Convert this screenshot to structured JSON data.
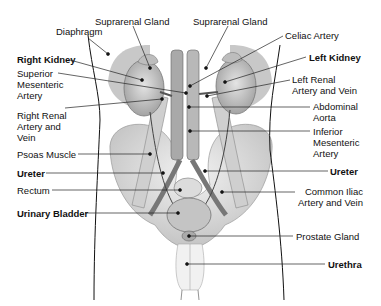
{
  "diagram": {
    "title_cutoff": "",
    "labels_left": [
      {
        "id": "diaphragm",
        "text": "Diaphragm",
        "bold": false
      },
      {
        "id": "right-kidney",
        "text": "Right Kidney",
        "bold": true
      },
      {
        "id": "superior-mesenteric-artery",
        "text": "Superior\nMesenteric\nArtery",
        "bold": false
      },
      {
        "id": "right-renal-artery-vein",
        "text": "Right Renal\nArtery and\nVein",
        "bold": false
      },
      {
        "id": "psoas-muscle",
        "text": "Psoas Muscle",
        "bold": false
      },
      {
        "id": "ureter-left-side",
        "text": "Ureter",
        "bold": true
      },
      {
        "id": "rectum",
        "text": "Rectum",
        "bold": false
      },
      {
        "id": "urinary-bladder",
        "text": "Urinary Bladder",
        "bold": true
      }
    ],
    "labels_top": [
      {
        "id": "suprarenal-gland-right",
        "text": "Suprarenal Gland",
        "bold": false
      },
      {
        "id": "suprarenal-gland-left",
        "text": "Suprarenal Gland",
        "bold": false
      }
    ],
    "labels_right": [
      {
        "id": "celiac-artery",
        "text": "Celiac Artery",
        "bold": false
      },
      {
        "id": "left-kidney",
        "text": "Left Kidney",
        "bold": true
      },
      {
        "id": "left-renal-artery-vein",
        "text": "Left Renal\nArtery and Vein",
        "bold": false
      },
      {
        "id": "abdominal-aorta",
        "text": "Abdominal\nAorta",
        "bold": false
      },
      {
        "id": "inferior-mesenteric-artery",
        "text": "Inferior\nMesenteric\nArtery",
        "bold": false
      },
      {
        "id": "ureter-right-side",
        "text": "Ureter",
        "bold": true
      },
      {
        "id": "common-iliac-artery-vein",
        "text": "Common Iliac\nArtery and Vein",
        "bold": false
      },
      {
        "id": "prostate-gland",
        "text": "Prostate Gland",
        "bold": false
      },
      {
        "id": "urethra",
        "text": "Urethra",
        "bold": true
      }
    ],
    "colors": {
      "line": "#222222",
      "shade": "#b9b9b9",
      "tissue": "#d6d6d6",
      "background": "#ffffff"
    }
  }
}
